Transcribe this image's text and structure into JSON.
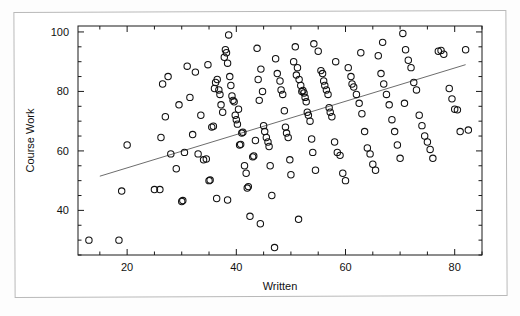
{
  "figure": {
    "kind": "scatterplot-with-regression-line",
    "background": "#ffffff",
    "marker_color": "#111111",
    "line_color": "#6d6d6d"
  },
  "chart_data": {
    "type": "scatter",
    "title": "",
    "xlabel": "Written",
    "ylabel": "Course Work",
    "xlim": [
      11,
      85
    ],
    "ylim": [
      25,
      102
    ],
    "xticks": [
      20,
      40,
      60,
      80
    ],
    "yticks": [
      40,
      60,
      80,
      100
    ],
    "xtick_labels": [
      "20",
      "40",
      "60",
      "80"
    ],
    "ytick_labels": [
      "40",
      "60",
      "80",
      "100"
    ],
    "minor_ticks": true,
    "grid": false,
    "legend": null,
    "marker": "open-circle",
    "n_points": 166,
    "trend_line": {
      "label": "least-squares fit",
      "x_start": 15,
      "y_start": 51.5,
      "x_end": 82,
      "y_end": 89.0
    },
    "points": [
      [
        13.0,
        30.0
      ],
      [
        18.5,
        30.0
      ],
      [
        19.0,
        46.5
      ],
      [
        20.0,
        62.0
      ],
      [
        25.0,
        47.0
      ],
      [
        26.0,
        47.0
      ],
      [
        26.2,
        64.5
      ],
      [
        26.5,
        82.5
      ],
      [
        27.0,
        71.5
      ],
      [
        28.0,
        59.0
      ],
      [
        29.0,
        54.0
      ],
      [
        29.5,
        75.5
      ],
      [
        30.0,
        43.0
      ],
      [
        30.2,
        43.3
      ],
      [
        30.5,
        59.5
      ],
      [
        31.0,
        88.5
      ],
      [
        31.5,
        78.0
      ],
      [
        32.0,
        65.5
      ],
      [
        32.5,
        86.5
      ],
      [
        33.0,
        59.0
      ],
      [
        33.5,
        72.0
      ],
      [
        34.0,
        57.0
      ],
      [
        34.5,
        57.3
      ],
      [
        35.0,
        50.0
      ],
      [
        35.2,
        50.2
      ],
      [
        35.5,
        68.0
      ],
      [
        35.8,
        68.3
      ],
      [
        36.0,
        81.0
      ],
      [
        36.2,
        83.0
      ],
      [
        36.5,
        84.0
      ],
      [
        36.8,
        80.5
      ],
      [
        37.0,
        79.0
      ],
      [
        37.2,
        75.5
      ],
      [
        37.5,
        73.0
      ],
      [
        37.8,
        91.5
      ],
      [
        38.0,
        94.0
      ],
      [
        38.2,
        93.0
      ],
      [
        38.4,
        89.5
      ],
      [
        38.6,
        99.0
      ],
      [
        38.8,
        85.0
      ],
      [
        39.0,
        82.0
      ],
      [
        39.2,
        78.5
      ],
      [
        39.4,
        77.0
      ],
      [
        39.6,
        76.5
      ],
      [
        39.8,
        72.0
      ],
      [
        40.0,
        70.5
      ],
      [
        40.2,
        69.0
      ],
      [
        40.4,
        74.0
      ],
      [
        40.6,
        62.0
      ],
      [
        40.8,
        62.2
      ],
      [
        41.0,
        66.0
      ],
      [
        41.2,
        66.3
      ],
      [
        41.5,
        55.0
      ],
      [
        41.8,
        52.5
      ],
      [
        42.0,
        47.5
      ],
      [
        42.2,
        48.0
      ],
      [
        42.5,
        38.0
      ],
      [
        43.0,
        58.0
      ],
      [
        43.2,
        58.3
      ],
      [
        43.5,
        63.5
      ],
      [
        44.0,
        84.0
      ],
      [
        44.2,
        77.0
      ],
      [
        44.5,
        87.5
      ],
      [
        44.8,
        80.0
      ],
      [
        45.0,
        68.5
      ],
      [
        45.2,
        66.5
      ],
      [
        45.5,
        64.5
      ],
      [
        45.8,
        63.0
      ],
      [
        46.0,
        61.5
      ],
      [
        46.2,
        55.0
      ],
      [
        46.5,
        45.0
      ],
      [
        47.0,
        27.5
      ],
      [
        47.5,
        86.0
      ],
      [
        48.0,
        83.5
      ],
      [
        48.2,
        80.5
      ],
      [
        48.5,
        79.0
      ],
      [
        48.8,
        73.5
      ],
      [
        49.0,
        68.0
      ],
      [
        49.2,
        66.0
      ],
      [
        49.5,
        64.5
      ],
      [
        49.8,
        57.0
      ],
      [
        50.0,
        52.0
      ],
      [
        50.5,
        90.0
      ],
      [
        51.0,
        85.5
      ],
      [
        51.2,
        88.0
      ],
      [
        51.5,
        84.0
      ],
      [
        51.8,
        82.0
      ],
      [
        52.0,
        80.0
      ],
      [
        52.2,
        80.3
      ],
      [
        52.4,
        79.5
      ],
      [
        52.6,
        78.0
      ],
      [
        52.8,
        76.5
      ],
      [
        53.0,
        73.0
      ],
      [
        53.2,
        72.0
      ],
      [
        53.5,
        70.0
      ],
      [
        53.8,
        64.0
      ],
      [
        54.0,
        59.5
      ],
      [
        54.5,
        53.5
      ],
      [
        55.0,
        93.5
      ],
      [
        55.5,
        87.0
      ],
      [
        55.8,
        86.0
      ],
      [
        56.0,
        83.5
      ],
      [
        56.2,
        82.0
      ],
      [
        56.5,
        80.5
      ],
      [
        56.8,
        79.0
      ],
      [
        57.0,
        74.5
      ],
      [
        57.2,
        73.0
      ],
      [
        57.5,
        71.5
      ],
      [
        58.0,
        63.0
      ],
      [
        58.5,
        59.5
      ],
      [
        59.0,
        58.5
      ],
      [
        59.5,
        52.5
      ],
      [
        60.0,
        50.0
      ],
      [
        60.5,
        88.0
      ],
      [
        61.0,
        85.0
      ],
      [
        61.2,
        82.5
      ],
      [
        61.5,
        81.5
      ],
      [
        62.0,
        79.0
      ],
      [
        62.5,
        76.0
      ],
      [
        63.0,
        72.5
      ],
      [
        63.5,
        66.5
      ],
      [
        64.0,
        61.0
      ],
      [
        64.5,
        59.0
      ],
      [
        65.0,
        55.5
      ],
      [
        65.5,
        53.5
      ],
      [
        66.0,
        92.0
      ],
      [
        66.5,
        86.0
      ],
      [
        67.0,
        82.5
      ],
      [
        67.5,
        79.0
      ],
      [
        68.0,
        75.5
      ],
      [
        68.5,
        70.5
      ],
      [
        69.0,
        66.5
      ],
      [
        69.5,
        62.0
      ],
      [
        70.0,
        57.5
      ],
      [
        70.5,
        99.5
      ],
      [
        71.0,
        94.0
      ],
      [
        71.5,
        90.5
      ],
      [
        72.0,
        88.0
      ],
      [
        72.5,
        83.0
      ],
      [
        73.0,
        80.5
      ],
      [
        73.5,
        72.0
      ],
      [
        74.0,
        68.5
      ],
      [
        74.5,
        65.0
      ],
      [
        75.0,
        63.0
      ],
      [
        75.5,
        60.5
      ],
      [
        76.0,
        57.5
      ],
      [
        77.0,
        93.5
      ],
      [
        77.5,
        93.8
      ],
      [
        78.0,
        92.5
      ],
      [
        79.0,
        81.0
      ],
      [
        79.5,
        77.5
      ],
      [
        80.0,
        74.0
      ],
      [
        80.5,
        73.8
      ],
      [
        81.0,
        66.5
      ],
      [
        82.0,
        94.0
      ],
      [
        82.5,
        67.0
      ],
      [
        27.5,
        85.0
      ],
      [
        34.8,
        89.0
      ],
      [
        43.8,
        94.5
      ],
      [
        47.2,
        91.0
      ],
      [
        50.8,
        95.0
      ],
      [
        54.2,
        96.0
      ],
      [
        58.2,
        90.0
      ],
      [
        62.8,
        93.0
      ],
      [
        66.8,
        96.5
      ],
      [
        70.8,
        76.0
      ],
      [
        36.4,
        44.0
      ],
      [
        38.4,
        43.5
      ],
      [
        44.4,
        35.5
      ],
      [
        51.4,
        37.0
      ]
    ]
  }
}
